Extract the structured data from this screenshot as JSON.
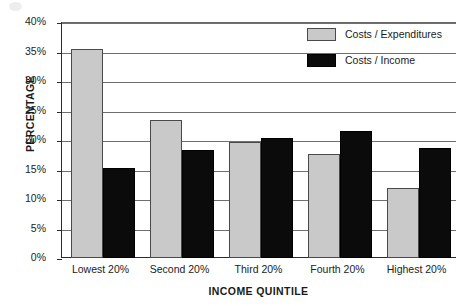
{
  "chart_data": {
    "type": "bar",
    "title": "",
    "xlabel": "INCOME QUINTILE",
    "ylabel": "PERCENTAGE",
    "categories": [
      "Lowest 20%",
      "Second 20%",
      "Third 20%",
      "Fourth 20%",
      "Highest 20%"
    ],
    "series": [
      {
        "name": "Costs / Expenditures",
        "color": "#c9c9c9",
        "values": [
          35.5,
          23.4,
          19.6,
          17.7,
          11.8
        ]
      },
      {
        "name": "Costs / Income",
        "color": "#0b0b0b",
        "values": [
          15.3,
          18.3,
          20.4,
          21.6,
          18.7
        ]
      }
    ],
    "ylim": [
      0,
      40
    ],
    "yticks": [
      "0%",
      "5%",
      "10%",
      "15%",
      "20%",
      "25%",
      "30%",
      "35%",
      "40%"
    ],
    "ytick_values": [
      0,
      5,
      10,
      15,
      20,
      25,
      30,
      35,
      40
    ],
    "grid": true,
    "legend_position": "top-right"
  },
  "legend": {
    "items": [
      {
        "label": "Costs / Expenditures",
        "swatch": "gray-swatch"
      },
      {
        "label": "Costs / Income",
        "swatch": "black-swatch"
      }
    ]
  }
}
